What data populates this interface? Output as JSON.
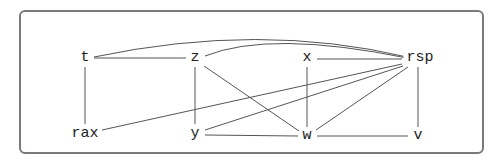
{
  "diagram": {
    "type": "interference-graph",
    "nodes": [
      {
        "id": "t",
        "label": "t",
        "x": 85,
        "y": 58
      },
      {
        "id": "z",
        "label": "z",
        "x": 195,
        "y": 58
      },
      {
        "id": "x",
        "label": "x",
        "x": 307,
        "y": 58
      },
      {
        "id": "rsp",
        "label": "rsp",
        "x": 418,
        "y": 58
      },
      {
        "id": "rax",
        "label": "rax",
        "x": 85,
        "y": 134
      },
      {
        "id": "y",
        "label": "y",
        "x": 195,
        "y": 134
      },
      {
        "id": "w",
        "label": "w",
        "x": 307,
        "y": 136
      },
      {
        "id": "v",
        "label": "v",
        "x": 418,
        "y": 136
      }
    ],
    "edges": [
      [
        "t",
        "z"
      ],
      [
        "t",
        "rsp"
      ],
      [
        "z",
        "rsp"
      ],
      [
        "x",
        "rsp"
      ],
      [
        "t",
        "rax"
      ],
      [
        "z",
        "y"
      ],
      [
        "x",
        "w"
      ],
      [
        "rsp",
        "v"
      ],
      [
        "z",
        "w"
      ],
      [
        "rsp",
        "rax"
      ],
      [
        "rsp",
        "y"
      ],
      [
        "rsp",
        "w"
      ],
      [
        "y",
        "w"
      ],
      [
        "w",
        "v"
      ]
    ]
  }
}
